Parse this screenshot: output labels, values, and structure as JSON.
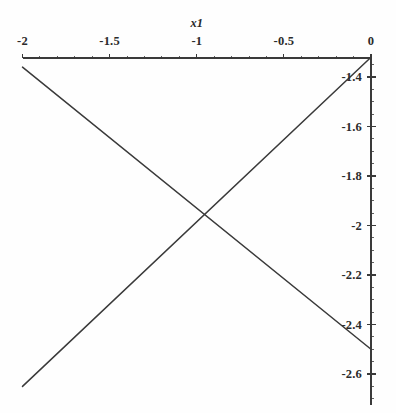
{
  "figure": {
    "width": 396,
    "height": 413,
    "background_color": "#fefefe",
    "ink_color": "#3a3a3a",
    "text_color": "#2b2b2b"
  },
  "chart_data": {
    "type": "line",
    "title": "",
    "xlabel": "x1",
    "ylabel": "",
    "xlim": [
      -2,
      0
    ],
    "ylim": [
      -2.7,
      -1.3
    ],
    "grid": false,
    "legend": null,
    "x_axis_position": "top",
    "y_axis_position": "right",
    "x_ticks": [
      -2,
      -1.5,
      -1,
      -0.5,
      0
    ],
    "x_tick_labels": [
      "-2",
      "-1.5",
      "-1",
      "-0.5",
      "0"
    ],
    "y_ticks": [
      -1.4,
      -1.6,
      -1.8,
      -2,
      -2.2,
      -2.4,
      -2.6
    ],
    "y_tick_labels": [
      "-1.4",
      "-1.6",
      "-1.8",
      "-2",
      "-2.2",
      "-2.4",
      "-2.6"
    ],
    "x_minor_tick_interval": 0.1,
    "y_minor_tick_interval": 0.05,
    "series": [
      {
        "name": "rising",
        "x": [
          -2,
          0
        ],
        "values": [
          -2.65,
          -1.32
        ]
      },
      {
        "name": "falling",
        "x": [
          -2,
          0
        ],
        "values": [
          -1.36,
          -2.5
        ]
      }
    ],
    "intersection": {
      "x": -1.01,
      "y": -1.99
    },
    "annotations": []
  }
}
